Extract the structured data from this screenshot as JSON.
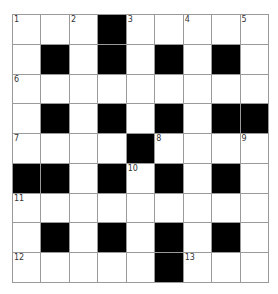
{
  "crossword": {
    "rows": 9,
    "cols": 9,
    "colors": {
      "block": "#000000",
      "cell": "#ffffff",
      "line": "#9a9a9a",
      "number": "#333333"
    },
    "grid": [
      "WWWBWWWWW",
      "WBWBWBWBW",
      "WWWWWWWWW",
      "WBWBWBWBB",
      "WWWWBWWWW",
      "BBWBWBWBW",
      "WWWWWWWWW",
      "WBWBWBWBW",
      "WWWWWBWWW"
    ],
    "numbers": [
      {
        "row": 0,
        "col": 0,
        "n": "1"
      },
      {
        "row": 0,
        "col": 2,
        "n": "2"
      },
      {
        "row": 0,
        "col": 4,
        "n": "3"
      },
      {
        "row": 0,
        "col": 6,
        "n": "4"
      },
      {
        "row": 0,
        "col": 8,
        "n": "5"
      },
      {
        "row": 2,
        "col": 0,
        "n": "6"
      },
      {
        "row": 4,
        "col": 0,
        "n": "7"
      },
      {
        "row": 4,
        "col": 5,
        "n": "8"
      },
      {
        "row": 4,
        "col": 8,
        "n": "9"
      },
      {
        "row": 5,
        "col": 4,
        "n": "10"
      },
      {
        "row": 6,
        "col": 0,
        "n": "11"
      },
      {
        "row": 8,
        "col": 0,
        "n": "12"
      },
      {
        "row": 8,
        "col": 6,
        "n": "13"
      }
    ]
  }
}
